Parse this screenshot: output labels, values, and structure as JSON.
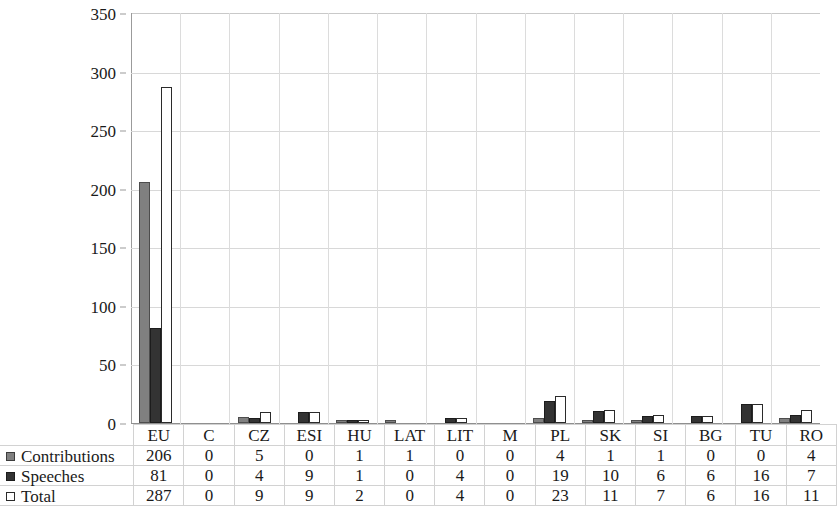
{
  "chart_data": {
    "type": "bar",
    "title": "",
    "xlabel": "",
    "ylabel": "",
    "ylim": [
      0,
      350
    ],
    "ytick_step": 50,
    "yticks": [
      0,
      50,
      100,
      150,
      200,
      250,
      300,
      350
    ],
    "grid": true,
    "legend_position": "bottom-left-table",
    "categories": [
      "EU",
      "C",
      "CZ",
      "ESI",
      "HU",
      "LAT",
      "LIT",
      "M",
      "PL",
      "SK",
      "SI",
      "BG",
      "TU",
      "RO"
    ],
    "series": [
      {
        "name": "Contributions",
        "color": "#808080",
        "values": [
          206,
          0,
          5,
          0,
          1,
          1,
          0,
          0,
          4,
          1,
          1,
          0,
          0,
          4
        ]
      },
      {
        "name": "Speeches",
        "color": "#333333",
        "values": [
          81,
          0,
          4,
          9,
          1,
          0,
          4,
          0,
          19,
          10,
          6,
          6,
          16,
          7
        ]
      },
      {
        "name": "Total",
        "color": "#ffffff",
        "values": [
          287,
          0,
          9,
          9,
          2,
          0,
          4,
          0,
          23,
          11,
          7,
          6,
          16,
          11
        ]
      }
    ]
  },
  "table": {
    "row_labels": [
      "Contributions",
      "Speeches",
      "Total"
    ],
    "header": [
      "EU",
      "C",
      "CZ",
      "ESI",
      "HU",
      "LAT",
      "LIT",
      "M",
      "PL",
      "SK",
      "SI",
      "BG",
      "TU",
      "RO"
    ],
    "rows": [
      [
        "206",
        "0",
        "5",
        "0",
        "1",
        "1",
        "0",
        "0",
        "4",
        "1",
        "1",
        "0",
        "0",
        "4"
      ],
      [
        "81",
        "0",
        "4",
        "9",
        "1",
        "0",
        "4",
        "0",
        "19",
        "10",
        "6",
        "6",
        "16",
        "7"
      ],
      [
        "287",
        "0",
        "9",
        "9",
        "2",
        "0",
        "4",
        "0",
        "23",
        "11",
        "7",
        "6",
        "16",
        "11"
      ]
    ]
  }
}
